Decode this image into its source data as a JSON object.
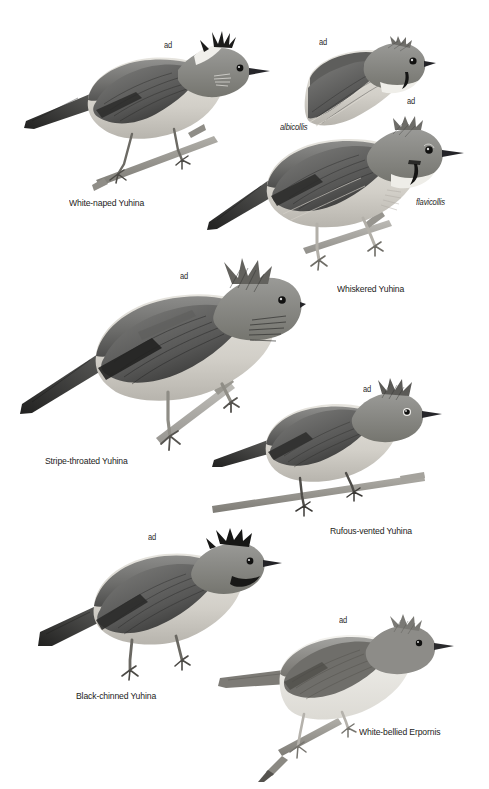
{
  "plate": {
    "background_color": "#ffffff",
    "ink_color": "#1d1d1b",
    "width": 489,
    "height": 789,
    "style": "grayscale field-guide bird plate"
  },
  "figures": [
    {
      "id": "white-naped-yuhina",
      "species_label": "White-naped Yuhina",
      "age_label": "ad",
      "subspecies_label": "",
      "pose": "perched on twig, facing right",
      "crest": "black spiky crest",
      "nape_patch": "white",
      "upperparts_tone": "#6f6f6f",
      "underparts_tone": "#d5d2cb"
    },
    {
      "id": "whiskered-yuhina-albicollis",
      "species_label": "",
      "age_label": "ad",
      "subspecies_label": "albicollis",
      "pose": "head and breast study, facing right",
      "crest": "grey crest",
      "throat_tone": "#eceae4",
      "upperparts_tone": "#5f5f5e"
    },
    {
      "id": "whiskered-yuhina-flavicollis",
      "species_label": "Whiskered Yuhina",
      "age_label": "ad",
      "subspecies_label": "flavicollis",
      "pose": "perched on twig, facing right",
      "crest": "grey crest with black malar whisker",
      "upperparts_tone": "#6a6a68",
      "underparts_tone": "#e3e0d9"
    },
    {
      "id": "stripe-throated-yuhina",
      "species_label": "Stripe-throated Yuhina",
      "age_label": "ad",
      "subspecies_label": "",
      "pose": "perched, facing right, long tail",
      "crest": "tall shaggy crest",
      "throat": "streaked throat",
      "upperparts_tone": "#767573",
      "underparts_tone": "#c9c6bf"
    },
    {
      "id": "rufous-vented-yuhina",
      "species_label": "Rufous-vented Yuhina",
      "age_label": "ad",
      "subspecies_label": "",
      "pose": "perched on branch, facing right",
      "crest": "spiky crest",
      "upperparts_tone": "#6e6e6c",
      "underparts_tone": "#b9b6af"
    },
    {
      "id": "black-chinned-yuhina",
      "species_label": "Black-chinned Yuhina",
      "age_label": "ad",
      "subspecies_label": "",
      "pose": "perched, facing right",
      "chin": "black chin",
      "upperparts_tone": "#707070",
      "underparts_tone": "#cdcac3"
    },
    {
      "id": "white-bellied-erpornis",
      "species_label": "White-bellied Erpornis",
      "age_label": "ad",
      "subspecies_label": "",
      "pose": "perched on branch, facing right",
      "crest": "short pale crest",
      "upperparts_tone": "#8a8a87",
      "underparts_tone": "#ecebe6"
    }
  ],
  "labels": {
    "ad_1": "ad",
    "ad_albicollis": "ad",
    "ad_flavicollis": "ad",
    "ad_stripe": "ad",
    "ad_rufous": "ad",
    "ad_black_chinned": "ad",
    "ad_erpornis": "ad",
    "albicollis": "albicollis",
    "flavicollis": "flavicollis",
    "white_naped_yuhina": "White-naped Yuhina",
    "whiskered_yuhina": "Whiskered Yuhina",
    "stripe_throated_yuhina": "Stripe-throated Yuhina",
    "rufous_vented_yuhina": "Rufous-vented Yuhina",
    "black_chinned_yuhina": "Black-chinned Yuhina",
    "white_bellied_erpornis": "White-bellied Erpornis"
  }
}
